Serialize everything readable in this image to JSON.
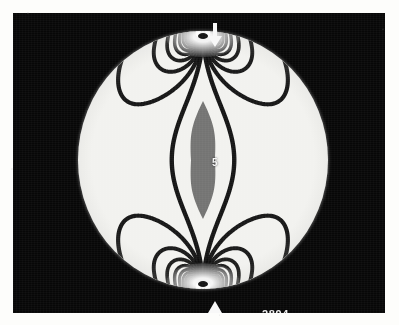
{
  "figure": {
    "kind": "photoelastic-fringe-photograph",
    "plate_number": "2894",
    "fringe_order_label": "5",
    "background_color": "#070707",
    "paper_color": "#fdfdfb",
    "disk_color": "#f2f2ef",
    "fringe_color": "#0d0d0d",
    "annotation_color": "#f6f6f6"
  },
  "geometry": {
    "photo": {
      "x": 13,
      "y": 13,
      "width": 372,
      "height": 300
    },
    "disk": {
      "center_x": 202,
      "center_y": 159,
      "radius_x": 125,
      "radius_y": 129
    }
  },
  "annotations": {
    "load_arrow_top": {
      "icon": "arrow-down-icon",
      "direction": "down",
      "x": 202,
      "y": 10
    },
    "load_arrow_bottom": {
      "icon": "arrow-up-icon",
      "direction": "up",
      "x": 202,
      "y": 288
    },
    "fringe_order": {
      "value": "5",
      "x": 202,
      "y": 150
    },
    "plate_id": {
      "value": "2894",
      "x": 249,
      "y": 296
    }
  },
  "chart_data": {
    "type": "contour",
    "xlabel": "",
    "ylabel": "",
    "grid": false,
    "legend": null,
    "axis_ranges": {
      "x": [
        -1,
        1
      ],
      "y": [
        -1,
        1
      ]
    },
    "annotations": [
      "5",
      "2894"
    ],
    "loading": {
      "type": "diametral point compression",
      "points": [
        {
          "label": "top load point",
          "x": 0.0,
          "y": 1.0,
          "arrow": "down"
        },
        {
          "label": "bottom load point",
          "x": 0.0,
          "y": -1.0,
          "arrow": "up"
        }
      ]
    },
    "fringe_orders": [
      1,
      2,
      3,
      4,
      5,
      6,
      7,
      8,
      9,
      10,
      11,
      12,
      13,
      14,
      15,
      16,
      17,
      18
    ],
    "labelled_fringe_order": 5,
    "fringes_on_horizontal_diameter_each_side": 5,
    "series": [
      {
        "name": "N = 1",
        "half_width_at_center": 0.98,
        "closed_loop_radius": 0.97
      },
      {
        "name": "N = 2",
        "half_width_at_center": 0.84,
        "closed_loop_radius": 0.74
      },
      {
        "name": "N = 3",
        "half_width_at_center": 0.68,
        "closed_loop_radius": 0.56
      },
      {
        "name": "N = 4",
        "half_width_at_center": 0.52,
        "closed_loop_radius": 0.43
      },
      {
        "name": "N = 5",
        "half_width_at_center": 0.36,
        "closed_loop_radius": 0.34
      },
      {
        "name": "N = 6",
        "half_width_at_center": 0.22,
        "closed_loop_radius": 0.27
      },
      {
        "name": "N = 7",
        "half_width_at_center": 0.12,
        "closed_loop_radius": 0.22
      },
      {
        "name": "N = 8",
        "half_width_at_center": 0.06,
        "closed_loop_radius": 0.18
      },
      {
        "name": "N = 9",
        "half_width_at_center": 0.0,
        "closed_loop_radius": 0.15
      },
      {
        "name": "N = 10",
        "half_width_at_center": 0.0,
        "closed_loop_radius": 0.125
      },
      {
        "name": "N = 11",
        "half_width_at_center": 0.0,
        "closed_loop_radius": 0.105
      },
      {
        "name": "N = 12",
        "half_width_at_center": 0.0,
        "closed_loop_radius": 0.088
      },
      {
        "name": "N = 13",
        "half_width_at_center": 0.0,
        "closed_loop_radius": 0.074
      },
      {
        "name": "N = 14",
        "half_width_at_center": 0.0,
        "closed_loop_radius": 0.062
      },
      {
        "name": "N = 15",
        "half_width_at_center": 0.0,
        "closed_loop_radius": 0.052
      },
      {
        "name": "N = 16",
        "half_width_at_center": 0.0,
        "closed_loop_radius": 0.043
      },
      {
        "name": "N = 17",
        "half_width_at_center": 0.0,
        "closed_loop_radius": 0.035
      },
      {
        "name": "N = 18",
        "half_width_at_center": 0.0,
        "closed_loop_radius": 0.028
      }
    ]
  }
}
